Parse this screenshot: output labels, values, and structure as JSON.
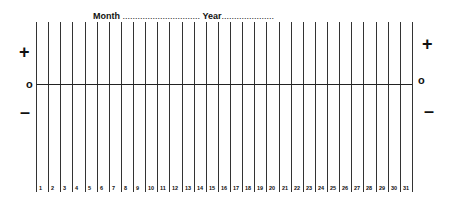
{
  "header": {
    "month_label": "Month",
    "month_dots": "...............................",
    "year_label": "Year",
    "year_dots": "....................."
  },
  "axis": {
    "plus_left": "+",
    "zero_left": "o",
    "minus_left": "–",
    "plus_right": "+",
    "zero_right": "o",
    "minus_right": "–"
  },
  "days": [
    "1",
    "2",
    "3",
    "4",
    "5",
    "6",
    "7",
    "8",
    "9",
    "10",
    "11",
    "12",
    "13",
    "14",
    "15",
    "16",
    "17",
    "18",
    "19",
    "20",
    "21",
    "22",
    "23",
    "24",
    "25",
    "26",
    "27",
    "28",
    "29",
    "30",
    "31"
  ]
}
